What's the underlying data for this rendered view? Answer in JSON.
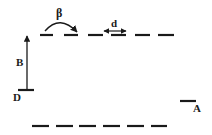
{
  "diagram": {
    "labels": {
      "beta": "β",
      "d": "d",
      "B": "B",
      "D": "D",
      "A": "A"
    },
    "colors": {
      "stroke": "#1a1a1a",
      "background": "#ffffff"
    },
    "top_row": {
      "y": 35,
      "segments": [
        [
          40,
          53
        ],
        [
          64,
          78
        ],
        [
          88,
          103
        ],
        [
          111,
          126
        ],
        [
          135,
          150
        ],
        [
          158,
          174
        ]
      ]
    },
    "bottom_row": {
      "y": 126,
      "segments": [
        [
          32,
          49
        ],
        [
          56,
          73
        ],
        [
          79,
          96
        ],
        [
          103,
          120
        ],
        [
          127,
          144
        ],
        [
          151,
          167
        ]
      ]
    },
    "level_D": {
      "x1": 18,
      "x2": 34,
      "y": 90
    },
    "level_A": {
      "x1": 180,
      "x2": 196,
      "y": 101
    },
    "arrow_B": {
      "x": 27,
      "y_from": 90,
      "y_to": 35
    },
    "arrow_d": {
      "x1": 103,
      "x2": 127,
      "y": 31
    },
    "arc_beta": {
      "x1": 45,
      "y1": 30,
      "x2": 77,
      "y2": 33
    }
  }
}
